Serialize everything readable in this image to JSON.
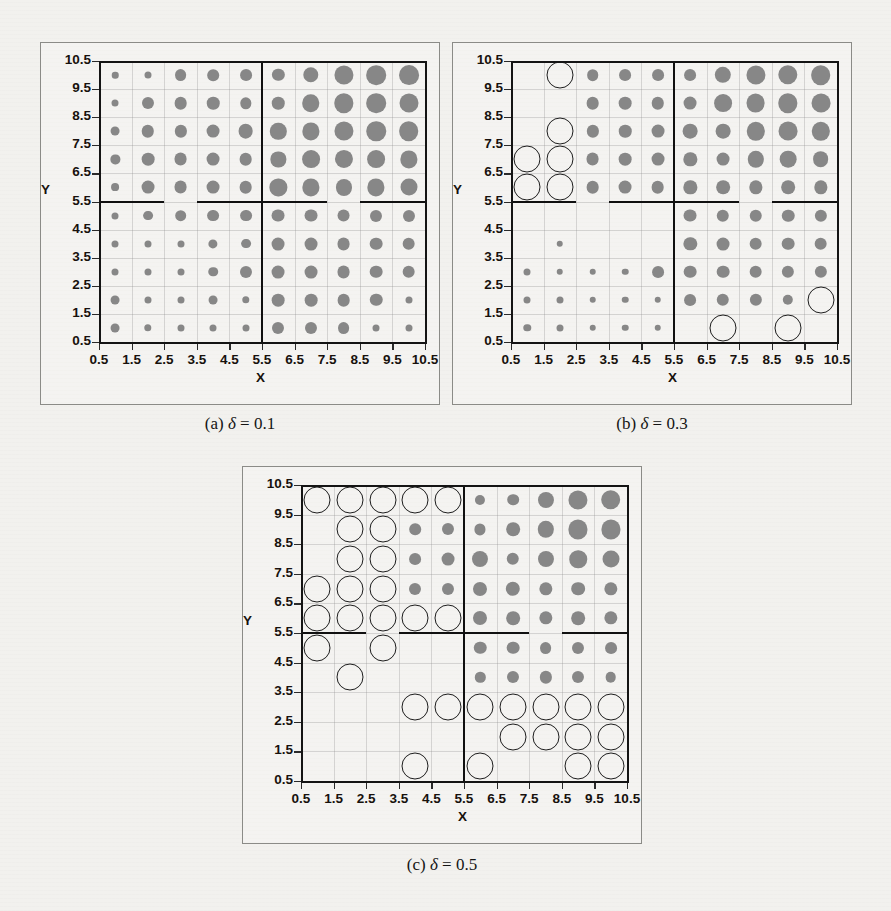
{
  "page": {
    "background": "#f2f1ee",
    "ghost_text_top": "bleed-through text from reverse page"
  },
  "figure": {
    "panels": [
      {
        "id": "panel-a",
        "caption_prefix": "(a)",
        "caption_symbol": "δ",
        "caption_eq": "=",
        "caption_value": "0.1",
        "caption_full": "(a) δ = 0.1"
      },
      {
        "id": "panel-b",
        "caption_prefix": "(b)",
        "caption_symbol": "δ",
        "caption_eq": "=",
        "caption_value": "0.3",
        "caption_full": "(b) δ = 0.3"
      },
      {
        "id": "panel-c",
        "caption_prefix": "(c)",
        "caption_symbol": "δ",
        "caption_eq": "=",
        "caption_value": "0.5",
        "caption_full": "(c) δ = 0.5"
      }
    ]
  },
  "axes": {
    "xlabel": "X",
    "ylabel": "Y",
    "xticks": [
      "0.5",
      "1.5",
      "2.5",
      "3.5",
      "4.5",
      "5.5",
      "6.5",
      "7.5",
      "8.5",
      "9.5",
      "10.5"
    ],
    "yticks": [
      "0.5",
      "1.5",
      "2.5",
      "3.5",
      "4.5",
      "5.5",
      "6.5",
      "7.5",
      "8.5",
      "9.5",
      "10.5"
    ],
    "xlim": [
      0.5,
      10.5
    ],
    "ylim": [
      0.5,
      10.5
    ]
  },
  "colors": {
    "filled_bubble": "#878787",
    "open_bubble_stroke": "#1d1d1d",
    "axis": "#141414",
    "partition": "#101010",
    "panel_border": "#8b8b87",
    "page_bg": "#f2f1ee"
  },
  "chart_data": {
    "type": "scatter",
    "xlabel": "X",
    "ylabel": "Y",
    "xlim": [
      0.5,
      10.5
    ],
    "ylim": [
      0.5,
      10.5
    ],
    "grid": true,
    "legend": null,
    "marker_encoding": {
      "filled_grey_circle": "magnitude encoded by radius",
      "open_black_circle": "flagged / selected cell, fixed large radius"
    },
    "size_scale": {
      "min_radius_px": 1.2,
      "max_radius_px": 11.5,
      "value_range": [
        0,
        10
      ]
    },
    "panels": [
      {
        "name": "(a) δ = 0.1",
        "delta": 0.1,
        "x": [
          1,
          2,
          3,
          4,
          5,
          6,
          7,
          8,
          9,
          10
        ],
        "y": [
          1,
          2,
          3,
          4,
          5,
          6,
          7,
          8,
          9,
          10
        ],
        "partitions": {
          "vertical": [
            {
              "x": 5.5,
              "y0": 0.5,
              "y1": 10.5
            }
          ],
          "horizontal": [
            {
              "y": 5.5,
              "x0": 0.5,
              "x1": 2.5
            },
            {
              "y": 5.5,
              "x0": 3.5,
              "x1": 7.5
            },
            {
              "y": 5.5,
              "x0": 8.5,
              "x1": 10.5
            }
          ]
        },
        "values_grid_rows_top_to_bottom": [
          {
            "y": 10,
            "values": [
              0.4,
              0.5,
              2.1,
              2.0,
              2.1,
              2.3,
              4.0,
              6.6,
              7.0,
              7.2
            ]
          },
          {
            "y": 9,
            "values": [
              0.5,
              2.2,
              2.5,
              2.4,
              1.9,
              2.4,
              5.4,
              6.8,
              7.0,
              6.5
            ]
          },
          {
            "y": 8,
            "values": [
              1.0,
              2.4,
              2.3,
              2.6,
              3.6,
              4.6,
              5.2,
              6.6,
              6.9,
              7.0
            ]
          },
          {
            "y": 7,
            "values": [
              1.1,
              2.5,
              2.6,
              2.6,
              2.5,
              3.9,
              5.6,
              5.8,
              5.6,
              5.2
            ]
          },
          {
            "y": 6,
            "values": [
              0.7,
              2.6,
              2.6,
              2.6,
              2.5,
              5.2,
              5.2,
              4.4,
              5.2,
              5.0
            ]
          },
          {
            "y": 5,
            "values": [
              0.5,
              1.3,
              2.0,
              2.1,
              2.1,
              2.6,
              2.6,
              2.6,
              2.2,
              2.2
            ]
          },
          {
            "y": 4,
            "values": [
              0.5,
              0.5,
              0.5,
              1.1,
              1.3,
              2.6,
              2.6,
              2.6,
              2.5,
              2.5
            ]
          },
          {
            "y": 3,
            "values": [
              0.5,
              0.5,
              0.5,
              1.2,
              2.2,
              2.6,
              2.6,
              2.6,
              2.5,
              2.5
            ]
          },
          {
            "y": 2,
            "values": [
              1.0,
              0.5,
              0.5,
              1.0,
              0.6,
              2.5,
              2.5,
              2.5,
              2.4,
              0.5
            ]
          },
          {
            "y": 1,
            "values": [
              1.0,
              0.6,
              0.5,
              0.5,
              0.5,
              2.2,
              2.2,
              2.1,
              0.5,
              0.5
            ]
          }
        ],
        "open_circles": []
      },
      {
        "name": "(b) δ = 0.3",
        "delta": 0.3,
        "x": [
          1,
          2,
          3,
          4,
          5,
          6,
          7,
          8,
          9,
          10
        ],
        "y": [
          1,
          2,
          3,
          4,
          5,
          6,
          7,
          8,
          9,
          10
        ],
        "partitions": {
          "vertical": [
            {
              "x": 5.5,
              "y0": 0.5,
              "y1": 10.5
            }
          ],
          "horizontal": [
            {
              "y": 5.5,
              "x0": 0.5,
              "x1": 2.5
            },
            {
              "y": 5.5,
              "x0": 3.5,
              "x1": 7.5
            },
            {
              "y": 5.5,
              "x0": 8.5,
              "x1": 10.5
            }
          ]
        },
        "values_grid_rows_top_to_bottom": [
          {
            "y": 10,
            "values": [
              0.0,
              0.0,
              2.0,
              2.1,
              2.1,
              2.1,
              4.6,
              6.6,
              6.8,
              7.0
            ]
          },
          {
            "y": 9,
            "values": [
              0.0,
              0.0,
              2.5,
              2.5,
              2.4,
              2.6,
              5.6,
              6.4,
              6.8,
              6.4
            ]
          },
          {
            "y": 8,
            "values": [
              0.0,
              0.0,
              2.3,
              2.4,
              2.6,
              3.6,
              3.6,
              6.0,
              6.4,
              6.0
            ]
          },
          {
            "y": 7,
            "values": [
              0.0,
              0.0,
              2.6,
              2.5,
              2.6,
              2.8,
              2.6,
              4.6,
              4.8,
              4.2
            ]
          },
          {
            "y": 6,
            "values": [
              0.0,
              0.0,
              2.5,
              2.6,
              2.5,
              2.8,
              3.0,
              2.8,
              3.0,
              2.8
            ]
          },
          {
            "y": 5,
            "values": [
              0.0,
              0.0,
              0.0,
              0.0,
              0.0,
              2.6,
              2.4,
              2.4,
              2.4,
              2.3
            ]
          },
          {
            "y": 4,
            "values": [
              0.0,
              0.4,
              0.0,
              0.0,
              0.0,
              2.8,
              2.6,
              2.5,
              2.5,
              2.5
            ]
          },
          {
            "y": 3,
            "values": [
              0.5,
              0.4,
              0.4,
              0.4,
              2.1,
              2.5,
              2.5,
              2.5,
              2.3,
              2.3
            ]
          },
          {
            "y": 2,
            "values": [
              0.5,
              0.5,
              0.4,
              0.4,
              0.4,
              2.1,
              2.4,
              2.3,
              1.5,
              0.0
            ]
          },
          {
            "y": 1,
            "values": [
              0.6,
              0.5,
              0.4,
              0.4,
              0.4,
              0.0,
              0.0,
              0.0,
              0.0,
              0.0
            ]
          }
        ],
        "open_circles": [
          {
            "x": 2,
            "y": 10
          },
          {
            "x": 2,
            "y": 8
          },
          {
            "x": 1,
            "y": 7
          },
          {
            "x": 2,
            "y": 7
          },
          {
            "x": 1,
            "y": 6
          },
          {
            "x": 2,
            "y": 6
          },
          {
            "x": 10,
            "y": 2
          },
          {
            "x": 7,
            "y": 1
          },
          {
            "x": 9,
            "y": 1
          }
        ]
      },
      {
        "name": "(c) δ = 0.5",
        "delta": 0.5,
        "x": [
          1,
          2,
          3,
          4,
          5,
          6,
          7,
          8,
          9,
          10
        ],
        "y": [
          1,
          2,
          3,
          4,
          5,
          6,
          7,
          8,
          9,
          10
        ],
        "partitions": {
          "vertical": [
            {
              "x": 5.5,
              "y0": 0.5,
              "y1": 10.5
            }
          ],
          "horizontal": [
            {
              "y": 5.5,
              "x0": 0.5,
              "x1": 2.5
            },
            {
              "y": 5.5,
              "x0": 3.5,
              "x1": 7.5
            },
            {
              "y": 5.5,
              "x0": 8.5,
              "x1": 10.5
            }
          ]
        },
        "values_grid_rows_top_to_bottom": [
          {
            "y": 10,
            "values": [
              0.0,
              0.0,
              0.0,
              0.0,
              0.0,
              1.4,
              2.0,
              4.4,
              6.6,
              7.0
            ]
          },
          {
            "y": 9,
            "values": [
              0.0,
              0.0,
              0.0,
              2.0,
              2.2,
              1.8,
              3.0,
              4.6,
              6.6,
              6.6
            ]
          },
          {
            "y": 8,
            "values": [
              0.0,
              0.0,
              0.0,
              2.1,
              2.6,
              4.4,
              2.4,
              4.4,
              5.4,
              5.0
            ]
          },
          {
            "y": 7,
            "values": [
              0.0,
              0.0,
              0.0,
              2.2,
              2.2,
              3.2,
              3.4,
              2.8,
              3.0,
              2.8
            ]
          },
          {
            "y": 6,
            "values": [
              0.0,
              0.0,
              0.0,
              0.0,
              0.0,
              3.2,
              3.0,
              2.8,
              3.0,
              2.8
            ]
          },
          {
            "y": 5,
            "values": [
              0.0,
              0.0,
              0.0,
              0.0,
              0.0,
              2.4,
              2.5,
              2.1,
              2.2,
              2.1
            ]
          },
          {
            "y": 4,
            "values": [
              0.0,
              0.0,
              0.0,
              0.0,
              0.0,
              1.5,
              2.2,
              2.3,
              2.2,
              1.6
            ]
          },
          {
            "y": 3,
            "values": [
              0.0,
              0.0,
              0.0,
              0.0,
              0.0,
              0.0,
              0.0,
              0.0,
              0.0,
              0.0
            ]
          },
          {
            "y": 2,
            "values": [
              0.0,
              0.0,
              0.0,
              0.0,
              0.0,
              0.0,
              0.0,
              0.0,
              0.0,
              0.0
            ]
          },
          {
            "y": 1,
            "values": [
              0.0,
              0.0,
              0.0,
              0.0,
              0.0,
              0.0,
              0.0,
              0.0,
              0.0,
              0.0
            ]
          }
        ],
        "open_circles": [
          {
            "x": 1,
            "y": 10
          },
          {
            "x": 2,
            "y": 10
          },
          {
            "x": 3,
            "y": 10
          },
          {
            "x": 4,
            "y": 10
          },
          {
            "x": 5,
            "y": 10
          },
          {
            "x": 2,
            "y": 9
          },
          {
            "x": 3,
            "y": 9
          },
          {
            "x": 2,
            "y": 8
          },
          {
            "x": 3,
            "y": 8
          },
          {
            "x": 1,
            "y": 7
          },
          {
            "x": 2,
            "y": 7
          },
          {
            "x": 3,
            "y": 7
          },
          {
            "x": 1,
            "y": 6
          },
          {
            "x": 2,
            "y": 6
          },
          {
            "x": 3,
            "y": 6
          },
          {
            "x": 4,
            "y": 6
          },
          {
            "x": 5,
            "y": 6
          },
          {
            "x": 1,
            "y": 5
          },
          {
            "x": 3,
            "y": 5
          },
          {
            "x": 2,
            "y": 4
          },
          {
            "x": 4,
            "y": 3
          },
          {
            "x": 5,
            "y": 3
          },
          {
            "x": 6,
            "y": 3
          },
          {
            "x": 7,
            "y": 3
          },
          {
            "x": 8,
            "y": 3
          },
          {
            "x": 9,
            "y": 3
          },
          {
            "x": 10,
            "y": 3
          },
          {
            "x": 7,
            "y": 2
          },
          {
            "x": 8,
            "y": 2
          },
          {
            "x": 9,
            "y": 2
          },
          {
            "x": 10,
            "y": 2
          },
          {
            "x": 4,
            "y": 1
          },
          {
            "x": 6,
            "y": 1
          },
          {
            "x": 9,
            "y": 1
          },
          {
            "x": 10,
            "y": 1
          }
        ]
      }
    ]
  }
}
